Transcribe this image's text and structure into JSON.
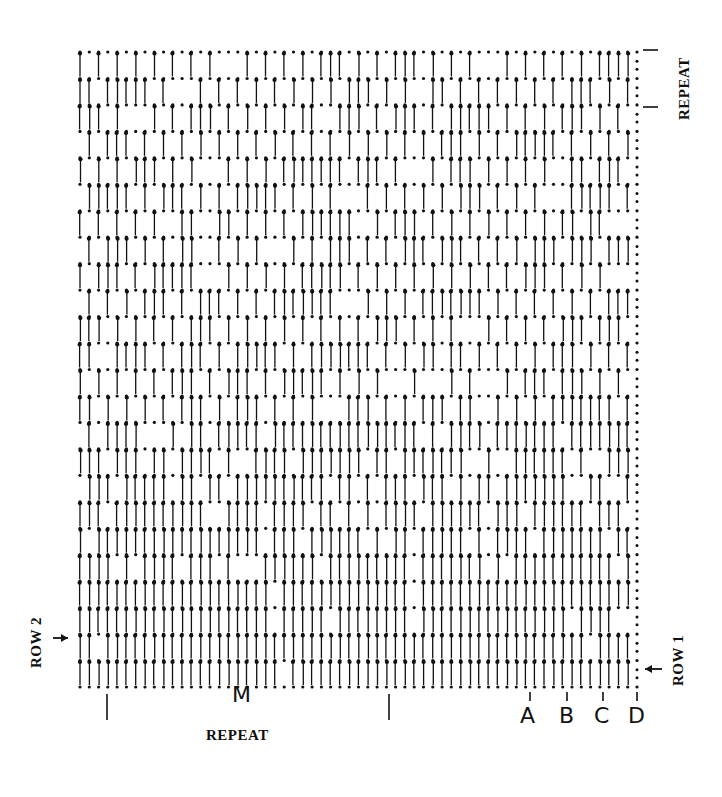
{
  "diagram": {
    "type": "crochet-stitch-chart",
    "grid": {
      "rows": 24,
      "columns": 61,
      "x_start": 80,
      "x_end": 637,
      "y_top": 52,
      "y_bottom": 687,
      "ink_color": "#111111"
    },
    "labels": {
      "repeat_bottom": "REPEAT",
      "repeat_right": "REPEAT",
      "center_mark": "M",
      "row2": "ROW 2",
      "row1": "ROW 1",
      "markers": [
        {
          "label": "A",
          "x": 530
        },
        {
          "label": "B",
          "x": 567
        },
        {
          "label": "C",
          "x": 603
        },
        {
          "label": "D",
          "x": 637
        }
      ],
      "repeat_bottom_ticks": [
        107,
        389
      ],
      "repeat_right_ticks": [
        50,
        107
      ]
    }
  }
}
